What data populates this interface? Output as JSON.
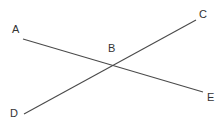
{
  "diagram": {
    "type": "intersecting-lines",
    "colors": {
      "line": "#4a4a4a",
      "label": "#333333",
      "background": "#ffffff"
    },
    "points": [
      {
        "id": "A",
        "label": "A",
        "x": 23,
        "y": 39,
        "lx": 12,
        "ly": 33
      },
      {
        "id": "B",
        "label": "B",
        "x": 113,
        "y": 65,
        "lx": 108,
        "ly": 52
      },
      {
        "id": "C",
        "label": "C",
        "x": 196,
        "y": 20,
        "lx": 199,
        "ly": 18
      },
      {
        "id": "D",
        "label": "D",
        "x": 24,
        "y": 114,
        "lx": 10,
        "ly": 117
      },
      {
        "id": "E",
        "label": "E",
        "x": 203,
        "y": 92,
        "lx": 207,
        "ly": 101
      }
    ],
    "segments": [
      {
        "id": "AE",
        "from": "A",
        "to": "E"
      },
      {
        "id": "DC",
        "from": "D",
        "to": "C"
      }
    ]
  }
}
